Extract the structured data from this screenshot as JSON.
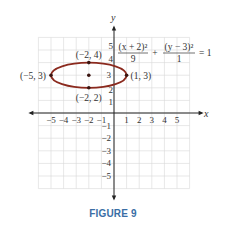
{
  "chart_data": {
    "type": "line",
    "title": "",
    "equation": {
      "term1_numerator": "(x + 2)²",
      "term1_denominator": "9",
      "plus": "+",
      "term2_numerator": "(y − 3)²",
      "term2_denominator": "1",
      "equals": "= 1"
    },
    "xlabel": "x",
    "ylabel": "y",
    "xlim": [
      -6,
      6
    ],
    "ylim": [
      -6,
      6
    ],
    "grid": true,
    "x_ticks": [
      "−5",
      "−4",
      "−3",
      "−2",
      "−1",
      "1",
      "2",
      "3",
      "4",
      "5"
    ],
    "y_ticks": [
      "5",
      "4",
      "3",
      "2",
      "1",
      "−1",
      "−2",
      "−3",
      "−4",
      "−5"
    ],
    "series": [
      {
        "name": "ellipse",
        "shape": "ellipse",
        "center": [
          -2,
          3
        ],
        "rx": 3,
        "ry": 1,
        "color": "#8b2a1e"
      }
    ],
    "points": [
      {
        "x": -5,
        "y": 3,
        "label": "(−5, 3)"
      },
      {
        "x": 1,
        "y": 3,
        "label": "(1, 3)"
      },
      {
        "x": -2,
        "y": 4,
        "label": "(−2, 4)"
      },
      {
        "x": -2,
        "y": 2,
        "label": "(−2, 2)"
      },
      {
        "x": -2,
        "y": 3,
        "label": ""
      }
    ]
  },
  "caption": "FIGURE 9",
  "colors": {
    "curve": "#8b2a1e",
    "grid": "#d6d6d6",
    "axis": "#222222",
    "caption": "#3a6ea5"
  }
}
